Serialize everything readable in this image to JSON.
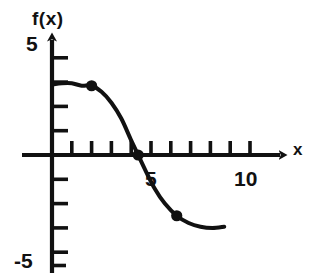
{
  "figure": {
    "ylabel": "f(x)",
    "xlabel": "x",
    "stroke_color": "#111111",
    "background_color": "#ffffff"
  },
  "labels": {
    "y_top": "5",
    "y_bottom": "-5",
    "x_mid": "5",
    "x_right": "10",
    "axis_y_name": "f(x)",
    "axis_x_name": "x"
  },
  "chart_data": {
    "type": "line",
    "title": "",
    "xlabel": "x",
    "ylabel": "f(x)",
    "xlim": [
      0,
      11.8
    ],
    "ylim": [
      -5,
      5
    ],
    "grid": false,
    "legend": "none",
    "x_ticks": [
      1,
      2,
      3,
      4,
      5,
      6,
      7,
      8,
      9,
      10
    ],
    "x_tick_labels_shown": [
      "5",
      "10"
    ],
    "y_ticks": [
      -4,
      -3,
      -2,
      -1,
      1,
      2,
      3,
      4
    ],
    "y_tick_labels_shown": [
      "5",
      "-5"
    ],
    "series": [
      {
        "name": "f(x)",
        "x": [
          0.0,
          0.5,
          1.0,
          1.5,
          2.0,
          2.5,
          3.0,
          3.5,
          4.0,
          4.35,
          4.7,
          5.2,
          5.7,
          6.3,
          6.9,
          7.5,
          8.1,
          8.7
        ],
        "y": [
          2.9,
          2.95,
          2.95,
          2.85,
          2.85,
          2.6,
          2.15,
          1.5,
          0.6,
          0.0,
          -0.6,
          -1.4,
          -2.0,
          -2.5,
          -2.8,
          -2.95,
          -3.0,
          -2.95
        ]
      }
    ],
    "marked_points": [
      {
        "x": 2.0,
        "y": 2.85,
        "label": ""
      },
      {
        "x": 4.35,
        "y": 0.0,
        "label": ""
      },
      {
        "x": 6.3,
        "y": -2.5,
        "label": ""
      }
    ]
  }
}
